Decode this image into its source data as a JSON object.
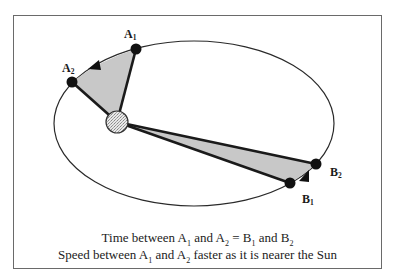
{
  "diagram": {
    "orbit": {
      "cx": 194,
      "cy": 123.5,
      "rx": 140,
      "ry": 82.5
    },
    "sun": {
      "label": "Sun",
      "cx": 117,
      "cy": 122,
      "r": 11
    },
    "points": {
      "A1": {
        "label": "A",
        "sub": "1",
        "x": 136,
        "y": 49
      },
      "A2": {
        "label": "A",
        "sub": "2",
        "x": 72,
        "y": 82
      },
      "B1": {
        "label": "B",
        "sub": "1",
        "x": 290,
        "y": 183
      },
      "B2": {
        "label": "B",
        "sub": "2",
        "x": 316,
        "y": 164
      }
    },
    "colors": {
      "sector_fill": "#c8c8c8",
      "line": "#1a1a1a",
      "frame": "#6a6a6a"
    }
  },
  "caption": {
    "line1_parts": {
      "t1": "Time between A",
      "s1": "1",
      "t2": " and A",
      "s2": "2",
      "t3": " = B",
      "s3": "1",
      "t4": " and B",
      "s4": "2"
    },
    "line2_parts": {
      "t1": "Speed between A",
      "s1": "1",
      "t2": " and A",
      "s2": "2",
      "t3": " faster as it is nearer the Sun"
    }
  }
}
